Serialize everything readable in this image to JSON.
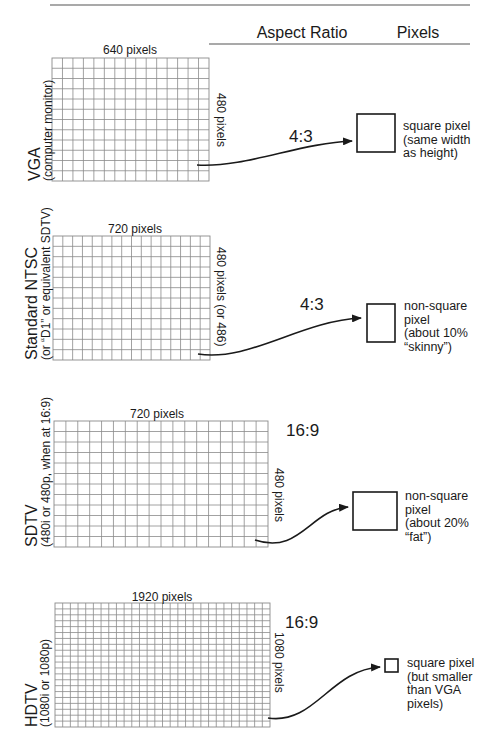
{
  "header": {
    "aspect_ratio_label": "Aspect Ratio",
    "pixels_label": "Pixels"
  },
  "colors": {
    "ink": "#1a1a1a",
    "grid": "#8a8a8a",
    "rule": "#555555",
    "background": "#ffffff"
  },
  "rows": [
    {
      "id": "vga",
      "name": "VGA",
      "subtitle": "(computer monitor)",
      "width_label": "640 pixels",
      "height_label": "480 pixels",
      "aspect_ratio": "4:3",
      "pixel_description": [
        "square pixel",
        "(same width",
        "as height)"
      ],
      "grid": {
        "x": 52,
        "y": 58,
        "w": 157,
        "h": 123,
        "cols": 15,
        "rows": 12
      },
      "box": {
        "x": 357,
        "y": 114,
        "w": 38,
        "h": 38
      },
      "arrow": {
        "d": "M197,165 C245,168 300,143 352,141",
        "tip": [
          352,
          141
        ]
      },
      "ratio_pos": [
        289,
        142
      ],
      "name_pos": [
        40,
        181
      ],
      "sub_pos": [
        52,
        181
      ],
      "width_label_pos": [
        130,
        54
      ],
      "height_label_pos": [
        217,
        93
      ],
      "desc_pos": [
        403,
        130
      ]
    },
    {
      "id": "ntsc",
      "name": "Standard NTSC",
      "subtitle": "(or “D1” or equivalent SDTV)",
      "width_label": "720 pixels",
      "height_label": "480 pixels (or 486)",
      "aspect_ratio": "4:3",
      "pixel_description": [
        "non-square",
        "pixel",
        "(about 10%",
        "“skinny”)"
      ],
      "grid": {
        "x": 53,
        "y": 236,
        "w": 157,
        "h": 124,
        "cols": 16,
        "rows": 12
      },
      "box": {
        "x": 367,
        "y": 304,
        "w": 28,
        "h": 38
      },
      "arrow": {
        "d": "M198,354 C250,362 300,321 361,318",
        "tip": [
          361,
          318
        ]
      },
      "ratio_pos": [
        300,
        310
      ],
      "name_pos": [
        37,
        360
      ],
      "sub_pos": [
        50,
        360
      ],
      "width_label_pos": [
        135,
        233
      ],
      "height_label_pos": [
        217,
        247
      ],
      "desc_pos": [
        404,
        310
      ]
    },
    {
      "id": "sdtv",
      "name": "SDTV",
      "subtitle": "(480i or 480p, when at 16:9)",
      "width_label": "720 pixels",
      "height_label": "480 pixels",
      "aspect_ratio": "16:9",
      "pixel_description": [
        "non-square",
        "pixel",
        "(about 20%",
        "“fat”)"
      ],
      "grid": {
        "x": 54,
        "y": 421,
        "w": 214,
        "h": 126,
        "cols": 18,
        "rows": 12
      },
      "box": {
        "x": 353,
        "y": 492,
        "w": 44,
        "h": 38
      },
      "arrow": {
        "d": "M255,540 C300,555 310,510 348,507",
        "tip": [
          348,
          507
        ]
      },
      "ratio_pos": [
        286,
        436
      ],
      "name_pos": [
        37,
        547
      ],
      "sub_pos": [
        50,
        547
      ],
      "width_label_pos": [
        157,
        418
      ],
      "height_label_pos": [
        275,
        468
      ],
      "desc_pos": [
        405,
        500
      ]
    },
    {
      "id": "hdtv",
      "name": "HDTV",
      "subtitle": "(1080i or 1080p)",
      "width_label": "1920 pixels",
      "height_label": "1080 pixels",
      "aspect_ratio": "16:9",
      "pixel_description": [
        "square pixel",
        "(but smaller",
        "than VGA",
        "pixels)"
      ],
      "grid": {
        "x": 55,
        "y": 603,
        "w": 215,
        "h": 124,
        "cols": 28,
        "rows": 21
      },
      "box": {
        "x": 385,
        "y": 659,
        "w": 13,
        "h": 13
      },
      "arrow": {
        "d": "M268,718 C315,725 330,670 380,667",
        "tip": [
          380,
          667
        ]
      },
      "ratio_pos": [
        285,
        628
      ],
      "name_pos": [
        37,
        727
      ],
      "sub_pos": [
        49,
        727
      ],
      "width_label_pos": [
        162,
        601
      ],
      "height_label_pos": [
        275,
        632
      ],
      "desc_pos": [
        407,
        667
      ]
    }
  ]
}
